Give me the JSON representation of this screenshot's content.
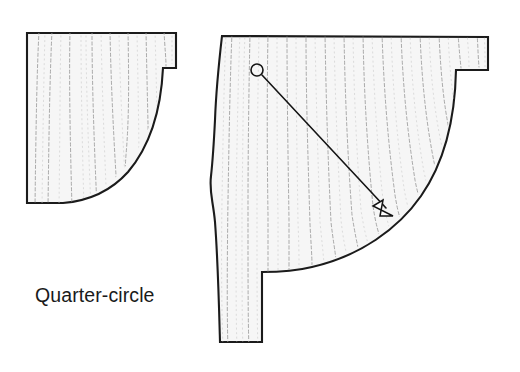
{
  "figure": {
    "caption": "Quarter-circle",
    "background_color": "#ffffff",
    "outline_color": "#1b1b1b",
    "fill_color": "#f6f6f6",
    "grain_color": "#9b9b9b",
    "leader_color": "#141414"
  },
  "shapes": [
    {
      "name": "left-quarter-circle-panel",
      "label": "Quarter-circle",
      "has_notch": true,
      "notch_position": "top-right",
      "arc_start": [
        163,
        68
      ],
      "arc_end": [
        63,
        203
      ],
      "corner_top_left": [
        27,
        33
      ],
      "corner_top_right": [
        176,
        33
      ],
      "corner_bottom_left": [
        27,
        203
      ]
    },
    {
      "name": "right-quarter-circle-panel",
      "has_notch": true,
      "notch_position": "top-right",
      "tail_notch_position": "bottom-left",
      "arc_start": [
        456,
        70
      ],
      "arc_end": [
        262,
        272
      ],
      "corner_top_left": [
        222,
        36
      ],
      "corner_top_right": [
        488,
        37
      ],
      "corner_bottom_left": [
        220,
        342
      ]
    }
  ],
  "annotations": [
    {
      "name": "radius-leader-arrow",
      "kind": "arrow",
      "origin_marker": "circle",
      "origin": [
        257,
        70
      ],
      "origin_radius": 6,
      "tip": [
        393,
        216
      ],
      "describes": "arc"
    }
  ],
  "caption": {
    "text": "Quarter-circle",
    "x": 35,
    "y": 302
  }
}
